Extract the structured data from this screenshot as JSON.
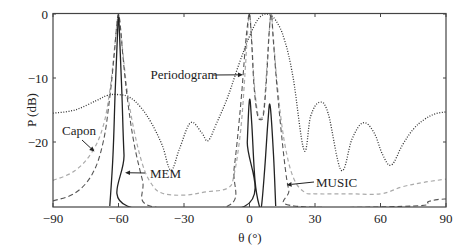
{
  "chart_data": {
    "type": "line",
    "title": "",
    "xlabel": "θ (°)",
    "ylabel": "P (dB)",
    "xlim": [
      -90,
      90
    ],
    "ylim": [
      -30,
      0
    ],
    "xticks": [
      -90,
      -60,
      -30,
      0,
      30,
      60,
      90
    ],
    "xtick_labels": [
      "−90",
      "−60",
      "−30",
      "0",
      "30",
      "60",
      "90"
    ],
    "yticks": [
      0,
      -10,
      -20
    ],
    "ytick_labels": [
      "0",
      "−10",
      "−20"
    ],
    "grid": false,
    "legend": "inline annotations with arrows",
    "series": [
      {
        "name": "Periodogram",
        "style": "dotted",
        "color": "#333333",
        "x": [
          -90,
          -80,
          -70,
          -65,
          -60,
          -55,
          -50,
          -45,
          -40,
          -36,
          -32,
          -27,
          -22,
          -19,
          -15,
          -10,
          -5,
          0,
          4,
          8,
          12,
          16,
          20,
          25,
          28,
          32,
          36,
          42,
          47,
          52,
          57,
          61,
          65,
          70,
          75,
          80,
          85,
          90
        ],
        "y": [
          -15.5,
          -15.0,
          -13.5,
          -12.7,
          -12.6,
          -13.0,
          -14.5,
          -17.0,
          -20.5,
          -24.4,
          -21.0,
          -17.0,
          -18.5,
          -19.8,
          -17.0,
          -13.0,
          -8.0,
          -3.5,
          -0.8,
          0,
          -1.0,
          -4.0,
          -10.0,
          -21.3,
          -16.0,
          -13.8,
          -15.5,
          -24.4,
          -19.5,
          -17.0,
          -18.5,
          -22.0,
          -23.6,
          -20.5,
          -18.0,
          -16.5,
          -15.6,
          -15.3
        ]
      },
      {
        "name": "Capon",
        "style": "dashed-light",
        "color": "#aaaaaa",
        "x": [
          -90,
          -80,
          -72,
          -67,
          -64,
          -62,
          -61,
          -60,
          -59,
          -58,
          -56,
          -53,
          -49,
          -45,
          -40,
          -30,
          -20,
          -10,
          -7,
          -4,
          -2,
          -1,
          0,
          1,
          2,
          3.5,
          5,
          6.5,
          8,
          9,
          10,
          11,
          13,
          16,
          20,
          25,
          30,
          45,
          60,
          70,
          80,
          90
        ],
        "y": [
          -26.0,
          -24.5,
          -21.5,
          -17.5,
          -12.0,
          -6.0,
          -2.5,
          0,
          -2.5,
          -6.0,
          -12.0,
          -18.0,
          -23.5,
          -26.5,
          -28.0,
          -28.3,
          -27.8,
          -27.2,
          -25.0,
          -18.0,
          -9.0,
          -3.5,
          0,
          -4.0,
          -10.0,
          -15.0,
          -16.3,
          -15.0,
          -8.0,
          -3.0,
          0,
          -4.0,
          -12.0,
          -20.0,
          -25.5,
          -27.8,
          -28.1,
          -28.1,
          -28.1,
          -27.0,
          -26.3,
          -25.8
        ]
      },
      {
        "name": "MUSIC",
        "style": "dashed-dark",
        "color": "#555555",
        "x": [
          -90,
          -80,
          -72,
          -67,
          -64,
          -62,
          -61,
          -60,
          -59,
          -58,
          -56,
          -53,
          -49,
          -45.5,
          -10,
          -7,
          -4,
          -2,
          -1,
          0,
          1,
          2,
          3.5,
          5,
          6.5,
          8,
          9,
          10,
          11,
          13,
          16,
          18,
          20.5,
          75,
          82,
          86,
          90
        ],
        "y": [
          -29.2,
          -28.0,
          -25.0,
          -20.0,
          -13.0,
          -6.5,
          -2.5,
          0,
          -2.5,
          -6.5,
          -13.0,
          -20.0,
          -26.0,
          -30.0,
          -30.0,
          -24.0,
          -14.0,
          -5.5,
          -2.0,
          0,
          -4.5,
          -11.0,
          -15.5,
          -16.5,
          -15.5,
          -9.0,
          -3.0,
          0,
          -4.5,
          -13.0,
          -23.0,
          -27.5,
          -30.0,
          -30.0,
          -29.3,
          -29.0,
          -28.9
        ]
      },
      {
        "name": "MEM",
        "style": "solid",
        "color": "#222222",
        "x": [
          -64,
          -62.5,
          -61.5,
          -60.5,
          -60,
          -59.5,
          -58.5,
          -57.5,
          -56,
          -2,
          -1,
          0,
          1,
          2.5,
          4.5,
          5.5,
          7,
          8.5,
          9.5,
          11,
          12
        ],
        "y": [
          -30.0,
          -22.0,
          -12.0,
          -3.5,
          0,
          -3.5,
          -12.0,
          -22.0,
          -30.0,
          -30.0,
          -20.0,
          -13.4,
          -17.0,
          -26.0,
          -30.0,
          -30.0,
          -24.0,
          -16.5,
          -14.4,
          -22.0,
          -30.0
        ]
      }
    ],
    "annotations": [
      {
        "text": "Periodogram",
        "points_to_deg": -3,
        "points_to_db": -9.5
      },
      {
        "text": "Capon",
        "points_to_deg": -71,
        "points_to_db": -21.5
      },
      {
        "text": "MEM",
        "points_to_deg": -57,
        "points_to_db": -24.8
      },
      {
        "text": "MUSIC",
        "points_to_deg": 17,
        "points_to_db": -26.7
      }
    ]
  },
  "axes": {
    "xlabel": "θ (°)",
    "ylabel": "P (dB)"
  }
}
